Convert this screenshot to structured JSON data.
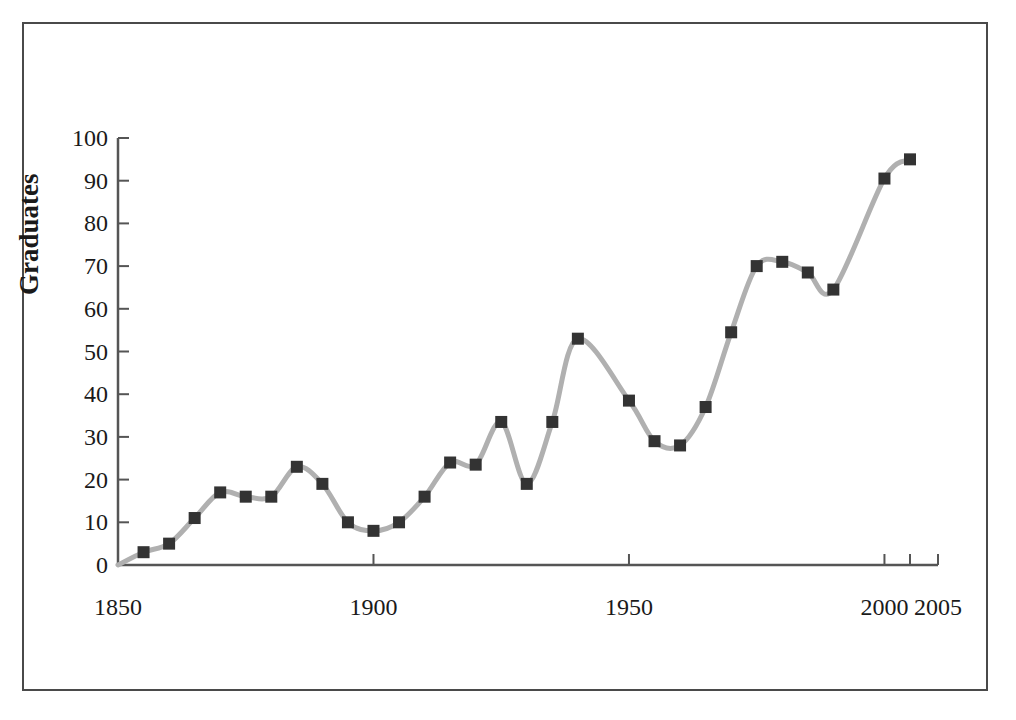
{
  "chart_data": {
    "type": "line",
    "title": "",
    "subtitle": "",
    "xlabel": "",
    "ylabel": "Graduates",
    "xlim": [
      1850,
      2005
    ],
    "ylim": [
      0,
      100
    ],
    "grid": false,
    "legend": "none",
    "marker": "filled-square",
    "line_color": "#b0b0b0",
    "marker_color": "#333333",
    "axis_color": "#555555",
    "frame_color": "#4a4a4a",
    "x_ticks": [
      1850,
      1900,
      1950,
      2000,
      2005
    ],
    "x_tick_labels": [
      "1850",
      "1900",
      "1950",
      "2000",
      "2005"
    ],
    "y_ticks": [
      0,
      10,
      20,
      30,
      40,
      50,
      60,
      70,
      80,
      90,
      100
    ],
    "y_tick_labels": [
      "0",
      "10",
      "20",
      "30",
      "40",
      "50",
      "60",
      "70",
      "80",
      "90",
      "100"
    ],
    "x": [
      1850,
      1855,
      1860,
      1865,
      1870,
      1875,
      1880,
      1885,
      1890,
      1895,
      1900,
      1905,
      1910,
      1915,
      1920,
      1925,
      1930,
      1935,
      1940,
      1950,
      1955,
      1960,
      1965,
      1970,
      1975,
      1980,
      1985,
      1990,
      2000,
      2005
    ],
    "values": [
      0,
      3,
      5,
      11,
      17,
      16,
      16,
      23,
      19,
      10,
      8,
      10,
      16,
      24,
      23.5,
      33.5,
      19,
      33.5,
      53,
      38.5,
      29,
      28,
      37,
      54.5,
      70,
      71,
      68.5,
      64.5,
      90.5,
      95
    ],
    "points": [
      {
        "x": 1850,
        "y": 0,
        "marker": false
      },
      {
        "x": 1855,
        "y": 3,
        "marker": true
      },
      {
        "x": 1860,
        "y": 5,
        "marker": true
      },
      {
        "x": 1865,
        "y": 11,
        "marker": true
      },
      {
        "x": 1870,
        "y": 17,
        "marker": true
      },
      {
        "x": 1875,
        "y": 16,
        "marker": true
      },
      {
        "x": 1880,
        "y": 16,
        "marker": true
      },
      {
        "x": 1885,
        "y": 23,
        "marker": true
      },
      {
        "x": 1890,
        "y": 19,
        "marker": true
      },
      {
        "x": 1895,
        "y": 10,
        "marker": true
      },
      {
        "x": 1900,
        "y": 8,
        "marker": true
      },
      {
        "x": 1905,
        "y": 10,
        "marker": true
      },
      {
        "x": 1910,
        "y": 16,
        "marker": true
      },
      {
        "x": 1915,
        "y": 24,
        "marker": true
      },
      {
        "x": 1920,
        "y": 23.5,
        "marker": true
      },
      {
        "x": 1925,
        "y": 33.5,
        "marker": true
      },
      {
        "x": 1930,
        "y": 19,
        "marker": true
      },
      {
        "x": 1935,
        "y": 33.5,
        "marker": true
      },
      {
        "x": 1940,
        "y": 53,
        "marker": true
      },
      {
        "x": 1950,
        "y": 38.5,
        "marker": true
      },
      {
        "x": 1955,
        "y": 29,
        "marker": true
      },
      {
        "x": 1960,
        "y": 28,
        "marker": true
      },
      {
        "x": 1965,
        "y": 37,
        "marker": true
      },
      {
        "x": 1970,
        "y": 54.5,
        "marker": true
      },
      {
        "x": 1975,
        "y": 70,
        "marker": true
      },
      {
        "x": 1980,
        "y": 71,
        "marker": true
      },
      {
        "x": 1985,
        "y": 68.5,
        "marker": true
      },
      {
        "x": 1990,
        "y": 64.5,
        "marker": true
      },
      {
        "x": 2000,
        "y": 90.5,
        "marker": true
      },
      {
        "x": 2005,
        "y": 95,
        "marker": true
      }
    ]
  }
}
